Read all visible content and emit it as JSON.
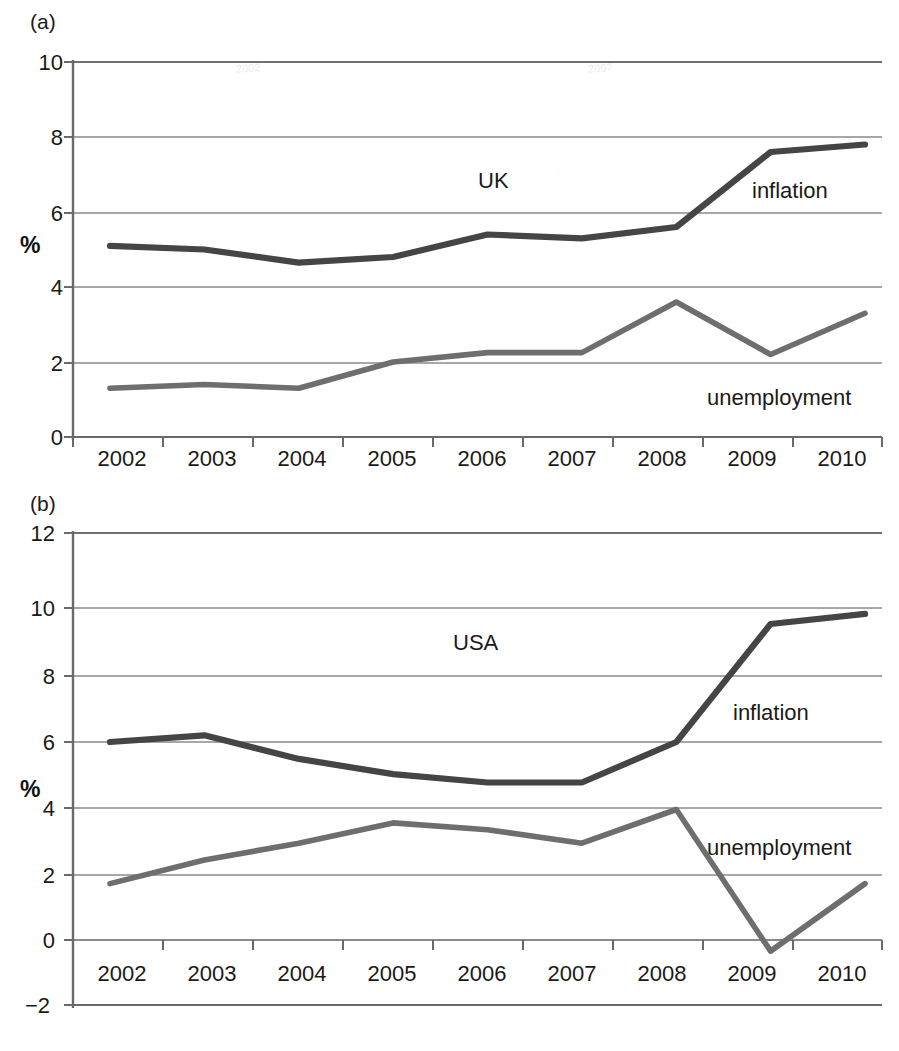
{
  "figure": {
    "panels": [
      {
        "tag": "(a)",
        "region": "UK",
        "ylabel": "%",
        "yticks": [
          "10",
          "8",
          "6",
          "4",
          "2",
          "0"
        ],
        "ytick_values": [
          10,
          8,
          6,
          4,
          2,
          0
        ],
        "xticks": [
          "2002",
          "2003",
          "2004",
          "2005",
          "2006",
          "2007",
          "2008",
          "2009",
          "2010"
        ],
        "series_labels": {
          "inflation": "inflation",
          "unemployment": "unemployment"
        }
      },
      {
        "tag": "(b)",
        "region": "USA",
        "ylabel": "%",
        "yticks": [
          "12",
          "10",
          "8",
          "6",
          "4",
          "2",
          "0",
          "−2"
        ],
        "ytick_values": [
          12,
          10,
          8,
          6,
          4,
          2,
          0,
          -2
        ],
        "xticks": [
          "2002",
          "2003",
          "2004",
          "2005",
          "2006",
          "2007",
          "2008",
          "2009",
          "2010"
        ],
        "series_labels": {
          "inflation": "inflation",
          "unemployment": "unemployment"
        }
      }
    ],
    "colors": {
      "inflation_line": "#454545",
      "unemployment_line": "#6e6e6e",
      "gridline": "#888888",
      "axis": "#666666",
      "text": "#1a1a1a",
      "background": "#ffffff"
    }
  },
  "chart_data": [
    {
      "type": "line",
      "title": "UK",
      "panel_tag": "(a)",
      "xlabel": "",
      "ylabel": "%",
      "x": [
        2002,
        2003,
        2004,
        2005,
        2006,
        2007,
        2008,
        2009,
        2010
      ],
      "categories": [
        "2002",
        "2003",
        "2004",
        "2005",
        "2006",
        "2007",
        "2008",
        "2009",
        "2010"
      ],
      "ylim": [
        0,
        10
      ],
      "ytick_step": 2,
      "grid": true,
      "legend": "inline-annotations",
      "series": [
        {
          "name": "inflation",
          "values": [
            5.1,
            5.0,
            4.65,
            4.8,
            5.4,
            5.3,
            5.6,
            7.6,
            7.8
          ]
        },
        {
          "name": "unemployment",
          "values": [
            1.3,
            1.4,
            1.3,
            2.0,
            2.25,
            2.25,
            3.6,
            2.2,
            3.3
          ]
        }
      ],
      "annotations": [
        {
          "text": "UK",
          "x": 2005.0,
          "y": 6.85
        },
        {
          "text": "inflation",
          "x": 2008.3,
          "y": 6.6
        },
        {
          "text": "unemployment",
          "x": 2008.3,
          "y": 1.0
        }
      ]
    },
    {
      "type": "line",
      "title": "USA",
      "panel_tag": "(b)",
      "xlabel": "",
      "ylabel": "%",
      "x": [
        2002,
        2003,
        2004,
        2005,
        2006,
        2007,
        2008,
        2009,
        2010
      ],
      "categories": [
        "2002",
        "2003",
        "2004",
        "2005",
        "2006",
        "2007",
        "2008",
        "2009",
        "2010"
      ],
      "ylim": [
        -2,
        12
      ],
      "ytick_step": 2,
      "grid": true,
      "legend": "inline-annotations",
      "series": [
        {
          "name": "inflation",
          "values": [
            5.8,
            6.0,
            5.3,
            4.85,
            4.6,
            4.6,
            5.8,
            9.3,
            9.6
          ]
        },
        {
          "name": "unemployment",
          "values": [
            1.6,
            2.3,
            2.8,
            3.4,
            3.2,
            2.8,
            3.8,
            -0.4,
            1.6
          ]
        }
      ],
      "annotations": [
        {
          "text": "USA",
          "x": 2005.0,
          "y": 9.0
        },
        {
          "text": "inflation",
          "x": 2008.3,
          "y": 7.0
        },
        {
          "text": "unemployment",
          "x": 2008.3,
          "y": 3.0
        }
      ]
    }
  ]
}
